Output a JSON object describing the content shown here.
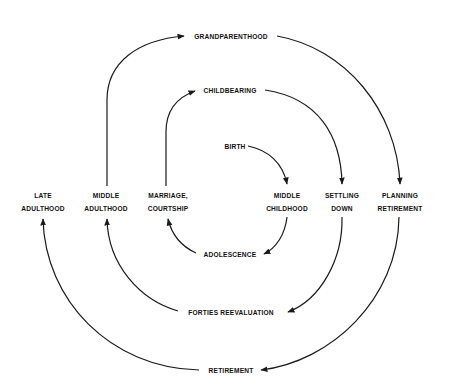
{
  "diagram": {
    "type": "spiral life-cycle flow",
    "nodes": {
      "grandparenthood": "GRANDPARENTHOOD",
      "childbearing": "CHILDBEARING",
      "birth": "BIRTH",
      "late_adulthood": [
        "LATE",
        "ADULTHOOD"
      ],
      "middle_adulthood": [
        "MIDDLE",
        "ADULTHOOD"
      ],
      "marriage_courtship": [
        "MARRIAGE,",
        "COURTSHIP"
      ],
      "middle_childhood": [
        "MIDDLE",
        "CHILDHOOD"
      ],
      "settling_down": [
        "SETTLING",
        "DOWN"
      ],
      "planning_retirement": [
        "PLANNING",
        "RETIREMENT"
      ],
      "adolescence": "ADOLESCENCE",
      "forties_reevaluation": "FORTIES REEVALUATION",
      "retirement": "RETIREMENT"
    },
    "edges": [
      {
        "from": "BIRTH",
        "to": "MIDDLE CHILDHOOD"
      },
      {
        "from": "MIDDLE CHILDHOOD",
        "to": "ADOLESCENCE"
      },
      {
        "from": "ADOLESCENCE",
        "to": "MARRIAGE, COURTSHIP"
      },
      {
        "from": "MARRIAGE, COURTSHIP",
        "to": "CHILDBEARING"
      },
      {
        "from": "CHILDBEARING",
        "to": "SETTLING DOWN"
      },
      {
        "from": "SETTLING DOWN",
        "to": "FORTIES REEVALUATION"
      },
      {
        "from": "FORTIES REEVALUATION",
        "to": "MIDDLE ADULTHOOD"
      },
      {
        "from": "MIDDLE ADULTHOOD",
        "to": "GRANDPARENTHOOD"
      },
      {
        "from": "GRANDPARENTHOOD",
        "to": "PLANNING RETIREMENT"
      },
      {
        "from": "PLANNING RETIREMENT",
        "to": "RETIREMENT"
      },
      {
        "from": "RETIREMENT",
        "to": "LATE ADULTHOOD"
      }
    ],
    "colors": {
      "line": "#1a1a1a",
      "text": "#111111",
      "background": "#ffffff"
    }
  }
}
